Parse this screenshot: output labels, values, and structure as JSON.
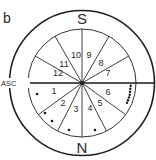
{
  "panel_label": "b",
  "cardinal": {
    "top": "S",
    "bottom": "N"
  },
  "ascendant_label": "ASC",
  "houses": [
    {
      "num": "1",
      "x": 54,
      "y": 94
    },
    {
      "num": "2",
      "x": 63,
      "y": 106
    },
    {
      "num": "3",
      "x": 76,
      "y": 112
    },
    {
      "num": "4",
      "x": 90,
      "y": 111
    },
    {
      "num": "5",
      "x": 100,
      "y": 106
    },
    {
      "num": "6",
      "x": 108,
      "y": 95
    },
    {
      "num": "7",
      "x": 108,
      "y": 76
    },
    {
      "num": "8",
      "x": 101,
      "y": 66
    },
    {
      "num": "9",
      "x": 89,
      "y": 58
    },
    {
      "num": "10",
      "x": 76,
      "y": 58
    },
    {
      "num": "11",
      "x": 64,
      "y": 67
    },
    {
      "num": "12",
      "x": 58,
      "y": 76
    }
  ],
  "geometry": {
    "center": [
      82,
      83
    ],
    "outer_radius": 72,
    "inner_radius": 54,
    "spoke_angles_deg": [
      30,
      60,
      120,
      150,
      216,
      243,
      297,
      324
    ]
  },
  "markers": [
    {
      "house": "1",
      "x": 37,
      "y": 94
    },
    {
      "house": "2",
      "x": 45,
      "y": 113
    },
    {
      "house": "2",
      "x": 52,
      "y": 121
    },
    {
      "house": "3",
      "x": 69,
      "y": 130
    },
    {
      "house": "4",
      "x": 95,
      "y": 130
    },
    {
      "house": "6",
      "x": 130.7,
      "y": 85.7
    },
    {
      "house": "6",
      "x": 130.3,
      "y": 88.7
    },
    {
      "house": "6",
      "x": 130,
      "y": 91.7
    },
    {
      "house": "6",
      "x": 129.7,
      "y": 94.7
    },
    {
      "house": "6",
      "x": 129,
      "y": 97.4
    },
    {
      "house": "6",
      "x": 128,
      "y": 100.2
    },
    {
      "house": "6",
      "x": 127,
      "y": 102.8
    }
  ]
}
